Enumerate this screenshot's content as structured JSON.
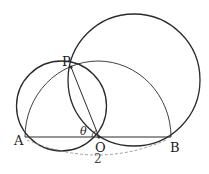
{
  "diagram": {
    "points": {
      "P": {
        "label": "P",
        "x": 71,
        "y": 67
      },
      "A": {
        "label": "A",
        "x": 25,
        "y": 137
      },
      "O": {
        "label": "O",
        "x": 99,
        "y": 137
      },
      "B": {
        "label": "B",
        "x": 171,
        "y": 137
      }
    },
    "angle_label": "θ",
    "distance_label": "2",
    "colors": {
      "stroke": "#2a2a2a",
      "dashed": "#888888",
      "background": "#ffffff"
    }
  }
}
